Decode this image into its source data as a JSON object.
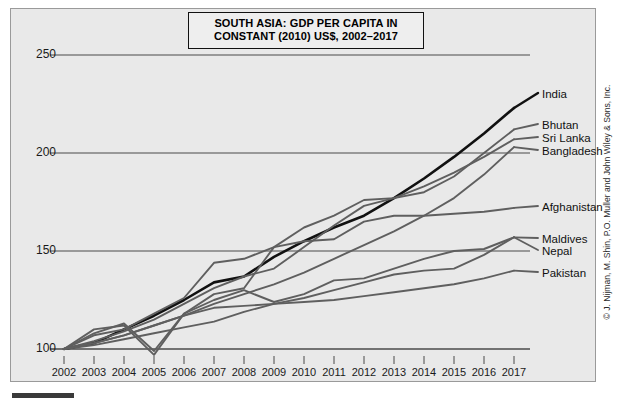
{
  "title": {
    "line1": "SOUTH ASIA: GDP PER CAPITA IN",
    "line2": "CONSTANT (2010) US$, 2002–2017"
  },
  "credit": "© J. Nijman, M. Shin, P.O. Muller and John Wiley & Sons, Inc.",
  "axes": {
    "y_ticks": [
      "100",
      "150",
      "200",
      "250"
    ],
    "x_ticks": [
      "2002",
      "2003",
      "2004",
      "2005",
      "2006",
      "2007",
      "2008",
      "2009",
      "2010",
      "2011",
      "2012",
      "2013",
      "2014",
      "2015",
      "2016",
      "2017"
    ]
  },
  "colors": {
    "background": "#e9e9e9",
    "grid": "#4a4a4a",
    "india": "#111111",
    "other": "#5f5f5f"
  },
  "chart_data": {
    "type": "line",
    "title": "SOUTH ASIA: GDP PER CAPITA IN CONSTANT (2010) US$, 2002–2017",
    "xlabel": "",
    "ylabel": "",
    "note": "Indexed values, 2002 = 100",
    "grid": true,
    "legend_position": "right-inline-labels",
    "xlim": [
      2002,
      2017
    ],
    "ylim": [
      90,
      255
    ],
    "x": [
      2002,
      2003,
      2004,
      2005,
      2006,
      2007,
      2008,
      2009,
      2010,
      2011,
      2012,
      2013,
      2014,
      2015,
      2016,
      2017
    ],
    "series": [
      {
        "name": "India",
        "values": [
          100,
          103,
          110,
          117,
          125,
          134,
          137,
          147,
          155,
          162,
          168,
          177,
          187,
          198,
          210,
          223
        ],
        "emphasis": true
      },
      {
        "name": "Bhutan",
        "values": [
          100,
          107,
          110,
          118,
          126,
          144,
          146,
          152,
          162,
          168,
          176,
          177,
          180,
          188,
          200,
          212
        ]
      },
      {
        "name": "Sri Lanka",
        "values": [
          100,
          104,
          109,
          115,
          123,
          131,
          137,
          141,
          152,
          163,
          173,
          177,
          183,
          190,
          198,
          207
        ]
      },
      {
        "name": "Bangladesh",
        "values": [
          100,
          103,
          107,
          112,
          117,
          123,
          128,
          133,
          139,
          146,
          153,
          160,
          168,
          177,
          189,
          203
        ]
      },
      {
        "name": "Afghanistan",
        "values": [
          100,
          110,
          112,
          97,
          118,
          128,
          131,
          152,
          155,
          156,
          165,
          168,
          168,
          169,
          170,
          172
        ]
      },
      {
        "name": "Maldives",
        "values": [
          100,
          108,
          113,
          99,
          118,
          125,
          130,
          124,
          128,
          135,
          136,
          141,
          146,
          150,
          151,
          157
        ]
      },
      {
        "name": "Nepal",
        "values": [
          100,
          102,
          105,
          108,
          111,
          114,
          119,
          123,
          126,
          130,
          134,
          138,
          140,
          141,
          148,
          157
        ]
      },
      {
        "name": "Pakistan",
        "values": [
          100,
          103,
          107,
          112,
          117,
          121,
          122,
          123,
          124,
          125,
          127,
          129,
          131,
          133,
          136,
          140
        ]
      }
    ]
  }
}
